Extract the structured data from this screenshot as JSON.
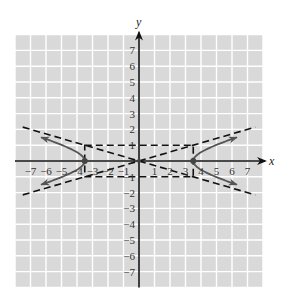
{
  "chart_data": {
    "type": "line",
    "title": "",
    "xlabel": "x",
    "ylabel": "y",
    "xlim": [
      -8,
      8
    ],
    "ylim": [
      -8,
      8
    ],
    "grid": true,
    "x_ticks": [
      -7,
      -6,
      -5,
      -4,
      -3,
      -2,
      -1,
      1,
      2,
      3,
      4,
      5,
      6,
      7
    ],
    "y_ticks": [
      7,
      6,
      5,
      4,
      3,
      2,
      1,
      -1,
      -2,
      -3,
      -4,
      -5,
      -6,
      -7
    ],
    "x_tick_labels": [
      "−7",
      "−6",
      "−5",
      "−4",
      "−3",
      "−2",
      "−1",
      "1",
      "2",
      "3",
      "4",
      "5",
      "6",
      "7"
    ],
    "y_tick_labels": [
      "7",
      "6",
      "5",
      "4",
      "3",
      "2",
      "1",
      "−1",
      "−2",
      "−3",
      "−4",
      "−5",
      "−6",
      "−7"
    ],
    "series": [
      {
        "name": "hyperbola",
        "equation": "x^2/12.25 - y^2/1 = 1",
        "style": "solid",
        "color": "#555555",
        "vertices": [
          [
            -3.5,
            0
          ],
          [
            3.5,
            0
          ]
        ],
        "branch_y_range": [
          -1.5,
          1.5
        ],
        "arrows": true
      },
      {
        "name": "asymptote-1",
        "equation": "y = 0.2857x",
        "style": "dashed",
        "color": "#111111"
      },
      {
        "name": "asymptote-2",
        "equation": "y = -0.2857x",
        "style": "dashed",
        "color": "#111111"
      },
      {
        "name": "fundamental-rectangle",
        "corners": [
          [
            -3.5,
            1
          ],
          [
            3.5,
            1
          ],
          [
            3.5,
            -1
          ],
          [
            -3.5,
            -1
          ]
        ],
        "style": "dashed",
        "color": "#111111"
      }
    ],
    "points": [
      [
        -3.5,
        0
      ],
      [
        3.5,
        0
      ],
      [
        0,
        0
      ]
    ],
    "colors": {
      "grid_background": "#d9d9d9",
      "grid_lines": "#ffffff",
      "axes": "#111111"
    }
  }
}
